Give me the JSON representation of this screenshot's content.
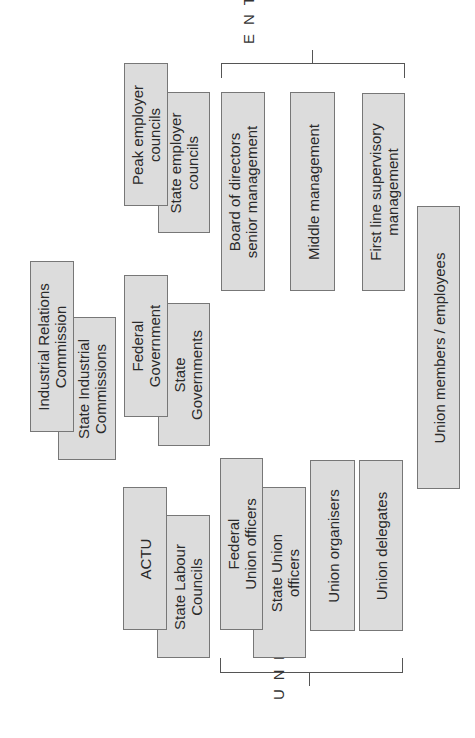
{
  "diagram": {
    "orientation": "rotated 90 degrees counter-clockwise",
    "groups": {
      "enterprise": {
        "label": "ENTERPRISE"
      },
      "union": {
        "label": "UNION"
      }
    },
    "boxes": {
      "peak_employer": "Peak employer\ncouncils",
      "state_employer": "State employer\ncouncils",
      "board": "Board of directors\nsenior management",
      "middle": "Middle management",
      "first_line": "First line supervisory\nmanagement",
      "members": "Union members / employees",
      "irc": "Industrial Relations\nCommission",
      "state_ind": "State Industrial\nCommissions",
      "federal_gov": "Federal\nGovernment",
      "state_gov": "State\nGovernments",
      "actu": "ACTU",
      "state_labour": "State Labour\nCouncils",
      "federal_union": "Federal\nUnion officers",
      "state_union": "State Union\nofficers",
      "organisers": "Union organisers",
      "delegates": "Union delegates"
    },
    "colors": {
      "box_fill": "#dcdcdc",
      "box_border": "#777777",
      "line": "#555555"
    }
  }
}
